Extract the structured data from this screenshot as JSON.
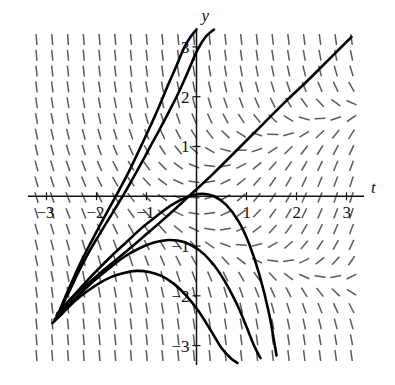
{
  "figure": {
    "kind": "slope-field-with-solution-curves",
    "background": "#ffffff",
    "curve_color": "#000000",
    "field_color": "#5a5a5a",
    "axis_color": "#111111"
  },
  "axes": {
    "x_axis_label": "t",
    "y_axis_label": "y",
    "x_ticks": [
      {
        "value": -3,
        "label": "−3"
      },
      {
        "value": -2,
        "label": "−2"
      },
      {
        "value": -1,
        "label": "−1"
      },
      {
        "value": 1,
        "label": "1"
      },
      {
        "value": 2,
        "label": "2"
      },
      {
        "value": 3,
        "label": "3"
      }
    ],
    "y_ticks": [
      {
        "value": 3,
        "label": "3"
      },
      {
        "value": 2,
        "label": "2"
      },
      {
        "value": 1,
        "label": "1"
      },
      {
        "value": -1,
        "label": "−1"
      },
      {
        "value": -2,
        "label": "−2"
      },
      {
        "value": -3,
        "label": "−3"
      }
    ]
  },
  "chart_data": {
    "type": "line",
    "title": "",
    "xlabel": "t",
    "ylabel": "y",
    "xlim": [
      -3.35,
      3.25
    ],
    "ylim": [
      -3.35,
      3.3
    ],
    "grid": false,
    "legend": null,
    "field": {
      "description": "direction field of dy/dt = t - y^2; short dashes show local slope",
      "equation": "dy/dt = t - y^2",
      "nx": 21,
      "ny": 21,
      "dash_length": 11,
      "x_range": [
        -3.2,
        3.1
      ],
      "y_range": [
        -3.2,
        3.15
      ]
    },
    "series": [
      {
        "name": "solution-curve-1",
        "note": "rises steeply, crosses y-axis near y=3.2",
        "points_t": [
          -2.72,
          -2.55,
          -2.35,
          -2.15,
          -1.95,
          -1.75,
          -1.55,
          -1.35,
          -1.15,
          -0.95,
          -0.75,
          -0.55,
          -0.4,
          -0.25,
          -0.12,
          0.0
        ],
        "points_y": [
          -2.25,
          -1.85,
          -1.4,
          -1.0,
          -0.62,
          -0.25,
          0.12,
          0.5,
          0.92,
          1.35,
          1.8,
          2.28,
          2.62,
          2.98,
          3.2,
          3.35
        ]
      },
      {
        "name": "solution-curve-2",
        "note": "crosses y-axis near y=2.0",
        "points_t": [
          -2.74,
          -2.55,
          -2.35,
          -2.15,
          -1.95,
          -1.75,
          -1.55,
          -1.35,
          -1.15,
          -0.95,
          -0.75,
          -0.55,
          -0.35,
          -0.15,
          0.0,
          0.18,
          0.35
        ],
        "points_y": [
          -2.3,
          -1.92,
          -1.5,
          -1.12,
          -0.78,
          -0.45,
          -0.12,
          0.22,
          0.58,
          0.95,
          1.32,
          1.7,
          2.1,
          2.55,
          2.9,
          3.2,
          3.35
        ]
      },
      {
        "name": "solution-curve-3",
        "note": "near-straight separatrix through origin, slope about 1",
        "points_t": [
          -2.78,
          -2.5,
          -2.2,
          -1.9,
          -1.6,
          -1.3,
          -1.0,
          -0.7,
          -0.4,
          -0.1,
          0.3,
          0.8,
          1.3,
          1.8,
          2.2,
          2.6,
          3.1
        ],
        "points_y": [
          -2.35,
          -2.05,
          -1.78,
          -1.52,
          -1.27,
          -1.02,
          -0.76,
          -0.5,
          -0.23,
          0.05,
          0.42,
          0.92,
          1.42,
          1.92,
          2.3,
          2.7,
          3.2
        ]
      },
      {
        "name": "solution-curve-4",
        "note": "peaks just right of origin near y=0.1 then falls",
        "points_t": [
          -2.8,
          -2.55,
          -2.3,
          -2.0,
          -1.7,
          -1.4,
          -1.1,
          -0.8,
          -0.5,
          -0.2,
          0.1,
          0.35,
          0.6,
          0.85,
          1.05,
          1.25,
          1.45,
          1.6
        ],
        "points_y": [
          -2.4,
          -2.1,
          -1.82,
          -1.5,
          -1.2,
          -0.92,
          -0.64,
          -0.4,
          -0.18,
          -0.02,
          0.05,
          0.0,
          -0.18,
          -0.52,
          -0.95,
          -1.55,
          -2.35,
          -3.2
        ]
      },
      {
        "name": "solution-curve-5",
        "note": "peaks near t=-0.4, y=-0.9 then falls steeply",
        "points_t": [
          -2.84,
          -2.6,
          -2.35,
          -2.05,
          -1.75,
          -1.45,
          -1.15,
          -0.85,
          -0.55,
          -0.25,
          0.05,
          0.3,
          0.55,
          0.8,
          1.0,
          1.15,
          1.28
        ],
        "points_y": [
          -2.48,
          -2.22,
          -1.98,
          -1.7,
          -1.45,
          -1.22,
          -1.05,
          -0.93,
          -0.88,
          -0.92,
          -1.08,
          -1.32,
          -1.68,
          -2.15,
          -2.62,
          -3.0,
          -3.25
        ]
      },
      {
        "name": "solution-curve-6",
        "note": "lowest curve, peaks near t=-1.0, y=-1.5",
        "points_t": [
          -2.88,
          -2.68,
          -2.45,
          -2.2,
          -1.95,
          -1.7,
          -1.45,
          -1.2,
          -0.95,
          -0.7,
          -0.45,
          -0.2,
          0.05,
          0.3,
          0.5,
          0.68,
          0.82
        ],
        "points_y": [
          -2.55,
          -2.35,
          -2.12,
          -1.92,
          -1.75,
          -1.62,
          -1.54,
          -1.5,
          -1.52,
          -1.6,
          -1.76,
          -2.0,
          -2.32,
          -2.72,
          -3.05,
          -3.25,
          -3.35
        ]
      }
    ],
    "convergence_point": {
      "t": -2.85,
      "y": -2.5
    }
  }
}
